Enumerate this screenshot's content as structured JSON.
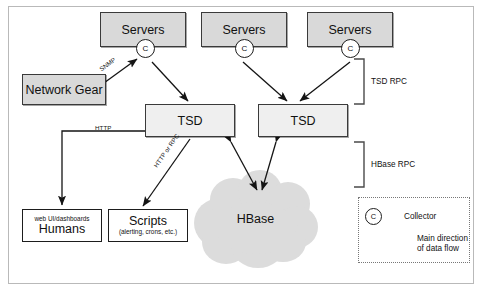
{
  "nodes": {
    "servers_1": {
      "label": "Servers"
    },
    "servers_2": {
      "label": "Servers"
    },
    "servers_3": {
      "label": "Servers"
    },
    "network_gear": {
      "label": "Network Gear"
    },
    "tsd_left": {
      "label": "TSD"
    },
    "tsd_right": {
      "label": "TSD"
    },
    "humans": {
      "sub_label": "web UI/dashboards",
      "label": "Humans"
    },
    "scripts": {
      "label": "Scripts",
      "sub_label": "(alerting, crons, etc.)"
    },
    "hbase": {
      "label": "HBase"
    }
  },
  "collectors": {
    "glyph": "C",
    "items": [
      {
        "name": "collector-1"
      },
      {
        "name": "collector-2"
      },
      {
        "name": "collector-3"
      }
    ]
  },
  "edge_labels": {
    "snmp": "SNMP",
    "http": "HTTP",
    "http_or_rpc": "HTTP or RPC"
  },
  "brackets": {
    "tsd_rpc": "TSD RPC",
    "hbase_rpc": "HBase RPC"
  },
  "legend": {
    "collector_glyph": "C",
    "collector_label": "Collector",
    "flow_label_line1": "Main direction",
    "flow_label_line2": "of data flow"
  },
  "colors": {
    "shaded_fill": "#d9d9d9",
    "light_fill": "#efefef",
    "cloud_fill": "#dcdcdc",
    "stroke": "#1d1d1d",
    "frame": "#b9b9b9"
  }
}
